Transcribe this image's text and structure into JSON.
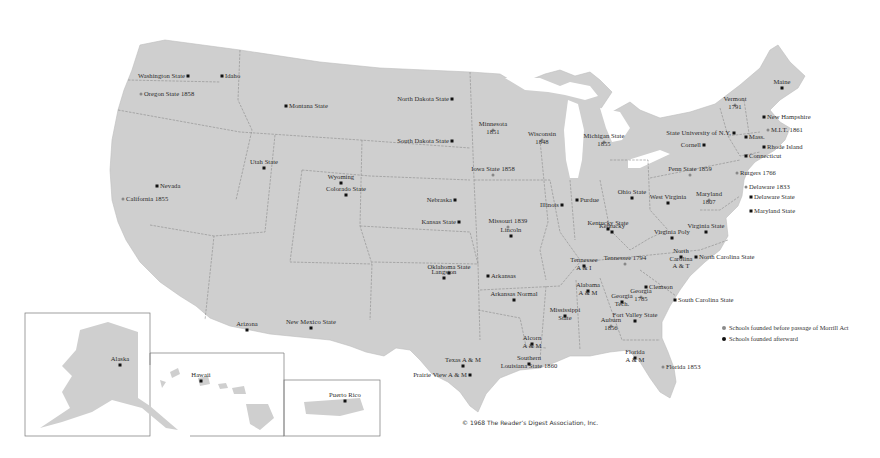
{
  "map": {
    "subject": "Land-grant colleges and universities of the United States",
    "colors": {
      "land": "#cfcfcf",
      "water": "#ffffff",
      "border": "#8a8a8a",
      "text": "#2a2a2a",
      "dot_after": "#111111",
      "dot_before": "#8a8a8a"
    },
    "schools": [
      {
        "name": "Washington State",
        "x": 188,
        "y": 76,
        "align": "r",
        "kind": "after"
      },
      {
        "name": "Idaho",
        "x": 222,
        "y": 76,
        "align": "l",
        "kind": "after"
      },
      {
        "name": "Oregon State 1858",
        "x": 141,
        "y": 94,
        "align": "l",
        "kind": "before"
      },
      {
        "name": "Montana State",
        "x": 286,
        "y": 106,
        "align": "l",
        "kind": "after"
      },
      {
        "name": "North Dakota State",
        "x": 452,
        "y": 99,
        "align": "r",
        "kind": "after"
      },
      {
        "name": "South Dakota State",
        "x": 452,
        "y": 141,
        "align": "r",
        "kind": "after"
      },
      {
        "name": "Minnesota\n1851",
        "x": 493,
        "y": 130,
        "align": "c",
        "kind": "before"
      },
      {
        "name": "Wisconsin\n1848",
        "x": 542,
        "y": 140,
        "align": "c",
        "kind": "before"
      },
      {
        "name": "Michigan State\n1855",
        "x": 604,
        "y": 142,
        "align": "c",
        "kind": "before"
      },
      {
        "name": "Iowa State 1858",
        "x": 493,
        "y": 175,
        "align": "c",
        "kind": "before"
      },
      {
        "name": "Nevada",
        "x": 157,
        "y": 186,
        "align": "l",
        "kind": "after"
      },
      {
        "name": "California 1855",
        "x": 123,
        "y": 199,
        "align": "l",
        "kind": "before"
      },
      {
        "name": "Utah State",
        "x": 264,
        "y": 168,
        "align": "c",
        "kind": "after"
      },
      {
        "name": "Wyoming",
        "x": 341,
        "y": 183,
        "align": "c",
        "kind": "after"
      },
      {
        "name": "Colorado State",
        "x": 346,
        "y": 195,
        "align": "c",
        "kind": "after"
      },
      {
        "name": "Nebraska",
        "x": 455,
        "y": 200,
        "align": "r",
        "kind": "after"
      },
      {
        "name": "Kansas State",
        "x": 459,
        "y": 222,
        "align": "r",
        "kind": "after"
      },
      {
        "name": "Missouri 1839",
        "x": 508,
        "y": 227,
        "align": "c",
        "kind": "before"
      },
      {
        "name": "Lincoln",
        "x": 511,
        "y": 236,
        "align": "c",
        "kind": "after"
      },
      {
        "name": "Illinois",
        "x": 562,
        "y": 205,
        "align": "r",
        "kind": "after"
      },
      {
        "name": "Purdue",
        "x": 577,
        "y": 200,
        "align": "l",
        "kind": "after"
      },
      {
        "name": "Ohio State",
        "x": 632,
        "y": 198,
        "align": "c",
        "kind": "after"
      },
      {
        "name": "Penn State 1859",
        "x": 690,
        "y": 175,
        "align": "c",
        "kind": "before"
      },
      {
        "name": "West Virginia",
        "x": 668,
        "y": 203,
        "align": "c",
        "kind": "after"
      },
      {
        "name": "Maryland\n1807",
        "x": 709,
        "y": 200,
        "align": "c",
        "kind": "before"
      },
      {
        "name": "Kentucky State",
        "x": 608,
        "y": 229,
        "align": "c",
        "kind": "after"
      },
      {
        "name": "Kentucky",
        "x": 612,
        "y": 232,
        "align": "c",
        "kind": "after"
      },
      {
        "name": "Virginia State",
        "x": 706,
        "y": 232,
        "align": "c",
        "kind": "after"
      },
      {
        "name": "Virginia Poly",
        "x": 672,
        "y": 238,
        "align": "c",
        "kind": "after"
      },
      {
        "name": "North\nCarolina\nA & T",
        "x": 681,
        "y": 257,
        "align": "c",
        "kind": "after"
      },
      {
        "name": "North Carolina State",
        "x": 696,
        "y": 257,
        "align": "l",
        "kind": "after"
      },
      {
        "name": "Tennessee 1794",
        "x": 625,
        "y": 264,
        "align": "c",
        "kind": "before"
      },
      {
        "name": "Tennessee\nA & I",
        "x": 584,
        "y": 266,
        "align": "c",
        "kind": "after"
      },
      {
        "name": "Oklahoma State",
        "x": 449,
        "y": 273,
        "align": "c",
        "kind": "after"
      },
      {
        "name": "Langston",
        "x": 444,
        "y": 278,
        "align": "c",
        "kind": "after"
      },
      {
        "name": "Arkansas",
        "x": 488,
        "y": 276,
        "align": "l",
        "kind": "after"
      },
      {
        "name": "Arkansas Normal",
        "x": 514,
        "y": 300,
        "align": "c",
        "kind": "after"
      },
      {
        "name": "Alabama\nA & M",
        "x": 588,
        "y": 291,
        "align": "c",
        "kind": "after"
      },
      {
        "name": "Clemson",
        "x": 646,
        "y": 287,
        "align": "l",
        "kind": "after"
      },
      {
        "name": "Georgia\n1785",
        "x": 641,
        "y": 297,
        "align": "c",
        "kind": "before"
      },
      {
        "name": "Georgia\nTech.",
        "x": 622,
        "y": 302,
        "align": "c",
        "kind": "after"
      },
      {
        "name": "South Carolina State",
        "x": 675,
        "y": 300,
        "align": "l",
        "kind": "after"
      },
      {
        "name": "Mississippi\nState",
        "x": 565,
        "y": 316,
        "align": "c",
        "kind": "after"
      },
      {
        "name": "Auburn\n1856",
        "x": 611,
        "y": 326,
        "align": "c",
        "kind": "before"
      },
      {
        "name": "Fort Valley State",
        "x": 635,
        "y": 321,
        "align": "c",
        "kind": "after"
      },
      {
        "name": "Alcorn\nA & M",
        "x": 532,
        "y": 344,
        "align": "c",
        "kind": "after"
      },
      {
        "name": "Southern\nLouisiana State 1860",
        "x": 529,
        "y": 364,
        "align": "c",
        "kind": "after"
      },
      {
        "name": "Texas A & M",
        "x": 463,
        "y": 366,
        "align": "c",
        "kind": "after"
      },
      {
        "name": "Prairie View A & M",
        "x": 470,
        "y": 375,
        "align": "r",
        "kind": "after"
      },
      {
        "name": "Florida\nA & M",
        "x": 635,
        "y": 358,
        "align": "c",
        "kind": "after"
      },
      {
        "name": "Florida 1853",
        "x": 663,
        "y": 367,
        "align": "l",
        "kind": "before"
      },
      {
        "name": "Arizona",
        "x": 247,
        "y": 330,
        "align": "c",
        "kind": "after"
      },
      {
        "name": "New Mexico State",
        "x": 311,
        "y": 328,
        "align": "c",
        "kind": "after"
      },
      {
        "name": "Maine",
        "x": 782,
        "y": 88,
        "align": "c",
        "kind": "after"
      },
      {
        "name": "Vermont\n1791",
        "x": 735,
        "y": 105,
        "align": "c",
        "kind": "before"
      },
      {
        "name": "New Hampshire",
        "x": 764,
        "y": 117,
        "align": "l",
        "kind": "after"
      },
      {
        "name": "M.I.T. 1861",
        "x": 768,
        "y": 130,
        "align": "l",
        "kind": "before"
      },
      {
        "name": "State University of N.Y.",
        "x": 734,
        "y": 133,
        "align": "r",
        "kind": "after"
      },
      {
        "name": "Mass.",
        "x": 746,
        "y": 137,
        "align": "l",
        "kind": "after"
      },
      {
        "name": "Cornell",
        "x": 704,
        "y": 145,
        "align": "r",
        "kind": "after"
      },
      {
        "name": "Rhode Island",
        "x": 764,
        "y": 147,
        "align": "l",
        "kind": "after"
      },
      {
        "name": "Connecticut",
        "x": 746,
        "y": 156,
        "align": "l",
        "kind": "after"
      },
      {
        "name": "Rutgers 1766",
        "x": 737,
        "y": 173,
        "align": "l",
        "kind": "before"
      },
      {
        "name": "Delaware 1833",
        "x": 746,
        "y": 187,
        "align": "l",
        "kind": "before"
      },
      {
        "name": "Delaware State",
        "x": 751,
        "y": 197,
        "align": "l",
        "kind": "after"
      },
      {
        "name": "Maryland State",
        "x": 751,
        "y": 211,
        "align": "l",
        "kind": "after"
      },
      {
        "name": "Alaska",
        "x": 120,
        "y": 365,
        "align": "c",
        "kind": "after"
      },
      {
        "name": "Hawaii",
        "x": 201,
        "y": 381,
        "align": "c",
        "kind": "after"
      },
      {
        "name": "Puerto Rico",
        "x": 345,
        "y": 401,
        "align": "c",
        "kind": "after"
      }
    ]
  },
  "legend": {
    "items": [
      {
        "label": "Schools founded before passage of Morrill Act",
        "kind": "before"
      },
      {
        "label": "Schools founded afterward",
        "kind": "after"
      }
    ]
  },
  "insets": {
    "alaska": "Alaska",
    "hawaii": "Hawaii",
    "puerto_rico": "Puerto Rico"
  },
  "copyright": "© 1968 The Reader’s Digest Association, Inc."
}
